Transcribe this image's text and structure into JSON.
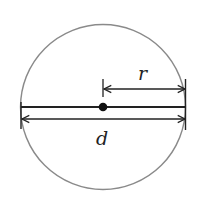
{
  "diagram": {
    "labels": {
      "radius": "r",
      "diameter": "d"
    },
    "colors": {
      "circle": "#8a8a8a",
      "lines": "#222222",
      "background": "#ffffff"
    }
  }
}
